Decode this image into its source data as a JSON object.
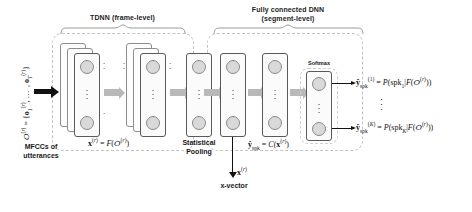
{
  "figure": {
    "groups": {
      "tdnn_label_line1": "TDNN (frame-level)",
      "dnn_label_line1": "Fully connected DNN",
      "dnn_label_line2": "(segment-level)"
    },
    "input": {
      "sequence_math": "O(r) = {o1(r), ..., oT(r)}",
      "caption_line1": "MFCCs of",
      "caption_line2": "utterances"
    },
    "frame_level": {
      "embedding_math": "x(r) = F(O(r))",
      "layers": 2
    },
    "pooling": {
      "label_line1": "Statistical",
      "label_line2": "Pooling"
    },
    "xvector": {
      "symbol": "x(r)",
      "label": "x-vector"
    },
    "segment_level": {
      "output_math": "y_spk = C(x(r))",
      "softmax_label": "Softmax",
      "layers": 2
    },
    "outputs": [
      {
        "id": "out-1",
        "text": "y_spk(1) = P(spk_1 | F(O(r)))"
      },
      {
        "id": "out-K",
        "text": "y_spk(K) = P(spk_K | F(O(r)))"
      }
    ],
    "ellipsis": "⋮",
    "colors": {
      "node_fill": "#d9d9d9",
      "node_stroke": "#8a8a8a",
      "card_stroke": "#5a5a5a",
      "dashed_stroke": "#c2c2c2",
      "grey_arrow": "#b9b9b9",
      "black": "#111111",
      "background": "#ffffff"
    }
  }
}
